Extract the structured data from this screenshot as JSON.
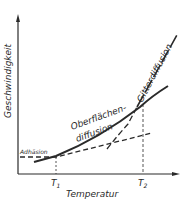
{
  "diagram": {
    "y_axis_label": "Geschwindigkeit",
    "x_axis_label": "Temperatur",
    "t1_label": "T",
    "t1_sub": "1",
    "t2_label": "T",
    "t2_sub": "2",
    "adhesion_label": "Adhäsion",
    "surface_label_line1": "Oberflächen-",
    "surface_label_line2": "diffusion",
    "lattice_label": "Gitterdiffusion",
    "colors": {
      "line": "#2a2a2a",
      "background": "#ffffff"
    }
  }
}
